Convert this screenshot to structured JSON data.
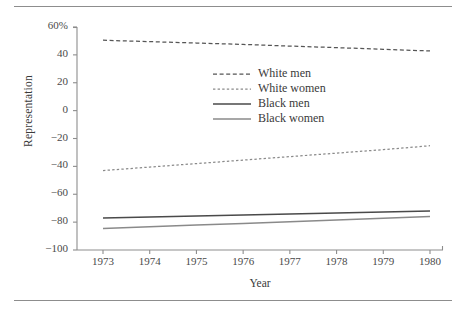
{
  "chart_data": {
    "type": "line",
    "title": "",
    "subtitle": "",
    "xlabel": "Year",
    "ylabel": "Representation",
    "x": [
      1973,
      1974,
      1975,
      1976,
      1977,
      1978,
      1979,
      1980
    ],
    "xtick_labels": [
      "1973",
      "1974",
      "1975",
      "1976",
      "1977",
      "1978",
      "1979",
      "1980"
    ],
    "xlim": [
      1972.6,
      1980.4
    ],
    "ylim": [
      -100,
      60
    ],
    "ytick_labels": [
      "60%",
      "40",
      "20",
      "0",
      "−20",
      "−40",
      "−60",
      "−80",
      "−100"
    ],
    "ytick_values": [
      60,
      40,
      20,
      0,
      -20,
      -40,
      -60,
      -80,
      -100
    ],
    "grid": false,
    "legend_position": "center",
    "series": [
      {
        "name": "White men",
        "style": "dashed",
        "color": "#555555",
        "values": [
          50.5,
          49.5,
          48.5,
          47.5,
          46.3,
          45.2,
          44.0,
          42.8
        ]
      },
      {
        "name": "White women",
        "style": "dotted",
        "color": "#8a8a8a",
        "values": [
          -43.0,
          -40.5,
          -38.0,
          -35.5,
          -33.0,
          -30.5,
          -28.0,
          -25.2
        ]
      },
      {
        "name": "Black men",
        "style": "solid",
        "color": "#4a4a4a",
        "values": [
          -77.0,
          -76.3,
          -75.6,
          -74.9,
          -74.2,
          -73.5,
          -72.8,
          -72.0
        ]
      },
      {
        "name": "Black women",
        "style": "solid",
        "color": "#8a8a8a",
        "values": [
          -84.5,
          -83.3,
          -82.1,
          -80.9,
          -79.7,
          -78.5,
          -77.3,
          -76.0
        ]
      }
    ]
  },
  "legend": {
    "entries": [
      {
        "label": "White men"
      },
      {
        "label": "White women"
      },
      {
        "label": "Black men"
      },
      {
        "label": "Black women"
      }
    ]
  },
  "colors": {
    "axis": "#8d8d8d",
    "rule": "#8d8d8d",
    "text": "#3a3a3a"
  }
}
